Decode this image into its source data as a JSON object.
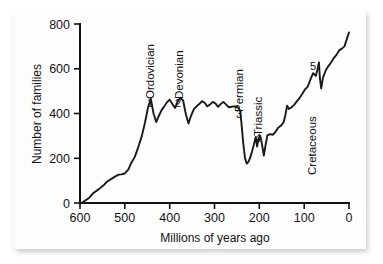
{
  "figure": {
    "kind": "line-chart",
    "background_color": "#ffffff",
    "card_color": "#fdfdfd",
    "ink_color": "#1a1a1a"
  },
  "chart_data": {
    "type": "line",
    "title": "",
    "subtitle": "",
    "xlabel": "Millions of years ago",
    "ylabel": "Number of families",
    "xlim": [
      600,
      0
    ],
    "ylim": [
      0,
      800
    ],
    "x_reversed": true,
    "grid": false,
    "legend": null,
    "legend_position": "none",
    "xticks": [
      600,
      500,
      400,
      300,
      200,
      100,
      0
    ],
    "xtick_labels": [
      "600",
      "500",
      "400",
      "300",
      "200",
      "100",
      "0"
    ],
    "yticks": [
      0,
      200,
      400,
      600,
      800
    ],
    "ytick_labels": [
      "0",
      "200",
      "400",
      "600",
      "800"
    ],
    "series": [
      {
        "name": "Marine animal families",
        "x": [
          595,
          580,
          570,
          558,
          548,
          540,
          530,
          522,
          515,
          508,
          500,
          492,
          486,
          478,
          470,
          462,
          455,
          448,
          442,
          436,
          430,
          424,
          418,
          412,
          406,
          400,
          394,
          388,
          382,
          376,
          370,
          364,
          358,
          352,
          346,
          340,
          334,
          328,
          322,
          316,
          310,
          304,
          298,
          292,
          286,
          280,
          274,
          268,
          262,
          256,
          252,
          249,
          247,
          245,
          243,
          240,
          236,
          232,
          228,
          224,
          220,
          216,
          212,
          208,
          205,
          202,
          198,
          194,
          190,
          186,
          182,
          176,
          170,
          164,
          158,
          152,
          146,
          142,
          138,
          134,
          128,
          122,
          116,
          110,
          104,
          98,
          92,
          86,
          80,
          74,
          70,
          67,
          65,
          62,
          58,
          52,
          46,
          40,
          34,
          28,
          22,
          16,
          10,
          4,
          0
        ],
        "y": [
          2,
          22,
          45,
          62,
          78,
          95,
          108,
          118,
          126,
          128,
          132,
          150,
          178,
          205,
          250,
          300,
          360,
          430,
          465,
          400,
          362,
          390,
          415,
          432,
          450,
          462,
          442,
          425,
          455,
          470,
          458,
          398,
          355,
          392,
          420,
          432,
          442,
          455,
          448,
          432,
          440,
          452,
          445,
          430,
          442,
          452,
          440,
          428,
          430,
          432,
          430,
          428,
          424,
          420,
          412,
          360,
          270,
          200,
          176,
          185,
          205,
          232,
          262,
          295,
          252,
          285,
          300,
          262,
          212,
          260,
          302,
          308,
          305,
          318,
          336,
          345,
          360,
          392,
          435,
          420,
          428,
          440,
          455,
          470,
          488,
          508,
          520,
          552,
          580,
          568,
          600,
          628,
          560,
          512,
          560,
          592,
          612,
          628,
          648,
          662,
          682,
          690,
          700,
          738,
          762
        ]
      }
    ],
    "annotations": [
      {
        "id": "era-ordovician",
        "text": "Ordovician",
        "marker": "1",
        "x": 447,
        "y": 465,
        "orientation": "vertical"
      },
      {
        "id": "era-devonian",
        "text": "Devonian",
        "marker": "2",
        "x": 372,
        "y": 470,
        "orientation": "vertical"
      },
      {
        "id": "era-permian",
        "text": "Permian",
        "marker": "3",
        "x": 252,
        "y": 430,
        "orientation": "vertical"
      },
      {
        "id": "era-triassic",
        "text": "Triassic",
        "marker": "4",
        "x": 208,
        "y": 300,
        "orientation": "vertical"
      },
      {
        "id": "era-cretaceous",
        "text": "Cretaceous",
        "marker": "5",
        "x": 66,
        "y": 628,
        "orientation": "vertical"
      }
    ]
  },
  "axes": {
    "y_title": "Number of families",
    "x_title": "Millions of years ago",
    "x_tick_labels": [
      "600",
      "500",
      "400",
      "300",
      "200",
      "100",
      "0"
    ],
    "y_tick_labels": [
      "800",
      "600",
      "400",
      "200",
      "0"
    ]
  },
  "labels": {
    "ordovician": "Ordovician",
    "devonian": "Devonian",
    "permian": "Permian",
    "triassic": "Triassic",
    "cretaceous": "Cretaceous"
  },
  "markers": {
    "one": "1",
    "two": "2",
    "three": "3",
    "four": "4",
    "five": "5"
  }
}
